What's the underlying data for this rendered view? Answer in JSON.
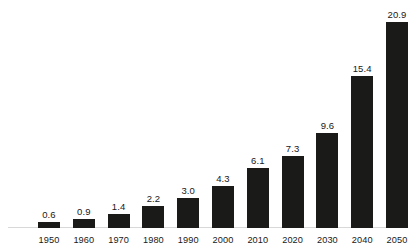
{
  "chart_data": {
    "type": "bar",
    "title": "",
    "subtitle": "",
    "xlabel": "",
    "ylabel": "",
    "categories": [
      "1950",
      "1960",
      "1970",
      "1980",
      "1990",
      "2000",
      "2010",
      "2020",
      "2030",
      "2040",
      "2050"
    ],
    "values": [
      0.6,
      0.9,
      1.4,
      2.2,
      3.0,
      4.3,
      6.1,
      7.3,
      9.6,
      15.4,
      20.9
    ],
    "value_labels": [
      "0.6",
      "0.9",
      "1.4",
      "2.2",
      "3.0",
      "4.3",
      "6.1",
      "7.3",
      "9.6",
      "15.4",
      "20.9"
    ],
    "ylim": [
      0,
      23
    ],
    "grid": false,
    "legend": false,
    "legend_position": "none",
    "series": [
      {
        "name": "",
        "values": [
          0.6,
          0.9,
          1.4,
          2.2,
          3.0,
          4.3,
          6.1,
          7.3,
          9.6,
          15.4,
          20.9
        ]
      }
    ],
    "colors": {
      "bar": "#1a1a18",
      "background": "#ffffff",
      "text": "#181818",
      "baseline": "#d8d8d8"
    }
  }
}
